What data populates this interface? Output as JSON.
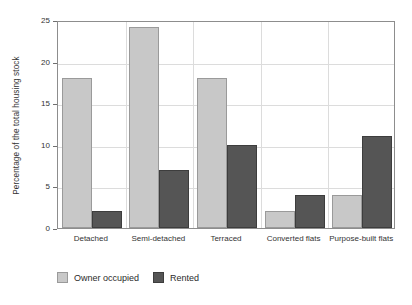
{
  "chart_data": {
    "type": "bar",
    "title": "",
    "xlabel": "",
    "ylabel": "Percentage of the total housing stock",
    "ylim": [
      0,
      25
    ],
    "yticks": [
      0,
      5,
      10,
      15,
      20,
      25
    ],
    "grid": true,
    "legend_position": "bottom-left",
    "categories": [
      "Detached",
      "Semi-detached",
      "Terraced",
      "Converted flats",
      "Purpose-built flats"
    ],
    "series": [
      {
        "name": "Owner occupied",
        "color": "#c8c8c8",
        "values": [
          18,
          24.2,
          18,
          2,
          4
        ]
      },
      {
        "name": "Rented",
        "color": "#555555",
        "values": [
          2,
          7,
          10,
          4,
          11
        ]
      }
    ]
  }
}
